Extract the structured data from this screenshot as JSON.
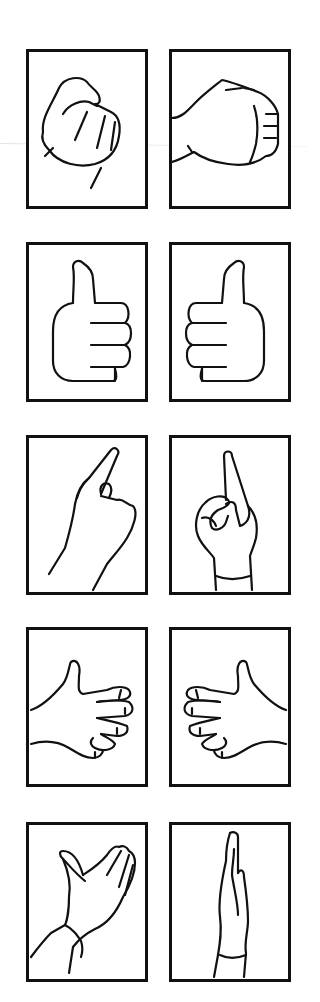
{
  "figure": {
    "rows": [
      {
        "left": {
          "gesture": "fist-front",
          "label": "Fist (front view)"
        },
        "right": {
          "gesture": "fist-side",
          "label": "Fist (side view)"
        }
      },
      {
        "left": {
          "gesture": "thumbs-up-left",
          "label": "Thumbs up"
        },
        "right": {
          "gesture": "thumbs-up-right",
          "label": "Thumbs up (mirrored)"
        }
      },
      {
        "left": {
          "gesture": "index-point-back",
          "label": "Index finger pointing (back)"
        },
        "right": {
          "gesture": "index-point-front",
          "label": "Index finger pointing (front)"
        }
      },
      {
        "left": {
          "gesture": "claw-hand-left",
          "label": "Curled fingers (left)"
        },
        "right": {
          "gesture": "claw-hand-right",
          "label": "Curled fingers (right)"
        }
      },
      {
        "left": {
          "gesture": "open-palm-angled",
          "label": "Open palm (angled)"
        },
        "right": {
          "gesture": "flat-hand-side",
          "label": "Flat hand (side)"
        }
      }
    ]
  },
  "colors": {
    "stroke": "#111111",
    "background": "#ffffff"
  }
}
